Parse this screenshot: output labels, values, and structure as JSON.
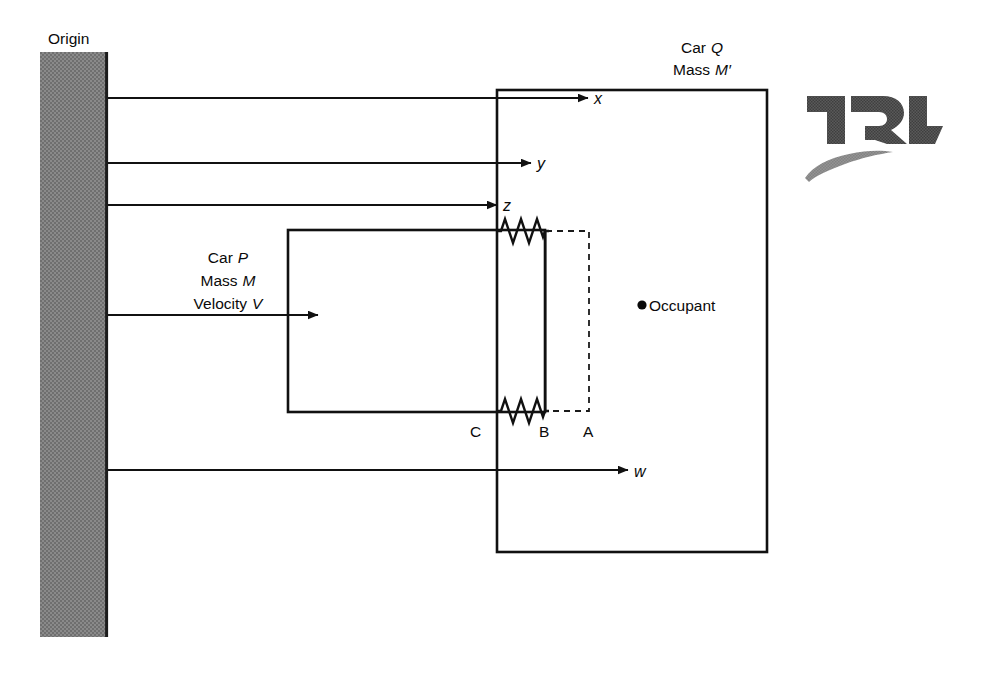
{
  "figure": {
    "kind": "physics-schematic",
    "background_color": "#ffffff",
    "line_color": "#111111"
  },
  "wall": {
    "label": "Origin",
    "fill_color": "#808080",
    "edge_color": "#1a1a1a",
    "x": 40,
    "y": 52,
    "width": 68,
    "height": 585
  },
  "reference_lines": [
    {
      "name": "x",
      "label": "x",
      "y": 98,
      "x_start": 108,
      "x_end": 588,
      "arrow": true
    },
    {
      "name": "y",
      "label": "y",
      "y": 163,
      "x_start": 108,
      "x_end": 531,
      "arrow": true
    },
    {
      "name": "z",
      "label": "z",
      "y": 205,
      "x_start": 108,
      "x_end": 497,
      "arrow": true
    },
    {
      "name": "w",
      "label": "w",
      "y": 470,
      "x_start": 108,
      "x_end": 628,
      "arrow": true
    }
  ],
  "velocity_arrow": {
    "name": "velocity-V-arrow",
    "y": 315,
    "x_start": 108,
    "x_end": 318,
    "arrow": true
  },
  "car_p": {
    "name": "Car P",
    "lines": [
      "Car P",
      "Mass M",
      "Velocity V"
    ],
    "label_title": "Car",
    "label_title_sym": "P",
    "label_mass": "Mass",
    "label_mass_sym": "M",
    "label_velocity": "Velocity",
    "label_velocity_sym": "V",
    "rect": {
      "x": 288,
      "y": 230,
      "width": 257,
      "height": 182
    }
  },
  "car_q": {
    "name": "Car Q",
    "lines": [
      "Car Q",
      "Mass M'"
    ],
    "label_title": "Car",
    "label_title_sym": "Q",
    "label_mass": "Mass",
    "label_mass_sym": "M′",
    "rect": {
      "x": 497,
      "y": 90,
      "width": 270,
      "height": 462
    }
  },
  "occupant": {
    "label": "Occupant",
    "marker": "filled-dot",
    "x": 637,
    "y": 305
  },
  "springs": [
    {
      "name": "upper-spring",
      "y": 231,
      "x_start": 497,
      "x_end": 545,
      "coils": 5
    },
    {
      "name": "lower-spring",
      "y": 411,
      "x_start": 497,
      "x_end": 545,
      "coils": 5
    }
  ],
  "interface_line_b": {
    "name": "line-B",
    "x": 545,
    "y_top": 231,
    "y_bottom": 411
  },
  "dashed_outline_a": {
    "name": "line-A-dashed",
    "x_left": 545,
    "x_right": 589,
    "y_top": 231,
    "y_bottom": 411
  },
  "point_labels": [
    {
      "label": "C",
      "x": 470,
      "y": 431
    },
    {
      "label": "B",
      "x": 540,
      "y": 431
    },
    {
      "label": "A",
      "x": 584,
      "y": 431
    }
  ],
  "logo": {
    "text": "TRL",
    "mark_color": "#4a4a4a",
    "swoosh_color": "#9a9a9a",
    "x": 805,
    "y": 90
  }
}
